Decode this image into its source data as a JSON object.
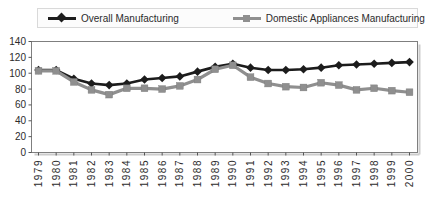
{
  "legend": {
    "items": [
      {
        "label": "Overall Manufacturing",
        "marker": "diamond",
        "color": "#1c1c1c"
      },
      {
        "label": "Domestic Appliances Manufacturing",
        "marker": "square",
        "color": "#8f8f8f"
      }
    ]
  },
  "chart_data": {
    "type": "line",
    "title": "",
    "xlabel": "",
    "ylabel": "",
    "x": [
      1979,
      1980,
      1981,
      1982,
      1983,
      1984,
      1985,
      1986,
      1987,
      1988,
      1989,
      1990,
      1991,
      1992,
      1993,
      1994,
      1995,
      1996,
      1997,
      1998,
      1999,
      2000
    ],
    "series": [
      {
        "name": "Overall Manufacturing",
        "marker": "diamond",
        "color": "#1c1c1c",
        "line_width": 2.6,
        "values": [
          104,
          104,
          93,
          87,
          85,
          87,
          92,
          94,
          96,
          102,
          108,
          112,
          107,
          104,
          104,
          105,
          107,
          110,
          111,
          112,
          113,
          114
        ]
      },
      {
        "name": "Domestic Appliances Manufacturing",
        "marker": "square",
        "color": "#8f8f8f",
        "line_width": 3.2,
        "values": [
          103,
          103,
          89,
          79,
          73,
          81,
          81,
          80,
          84,
          92,
          105,
          110,
          95,
          87,
          83,
          82,
          88,
          85,
          79,
          81,
          78,
          76
        ]
      }
    ],
    "ylim": [
      0,
      140
    ],
    "yticks": [
      0,
      20,
      40,
      60,
      80,
      100,
      120,
      140
    ],
    "grid": false,
    "legend_position": "top",
    "axis_color": "#7f7f7f",
    "shadow_color": "#cccccc"
  }
}
